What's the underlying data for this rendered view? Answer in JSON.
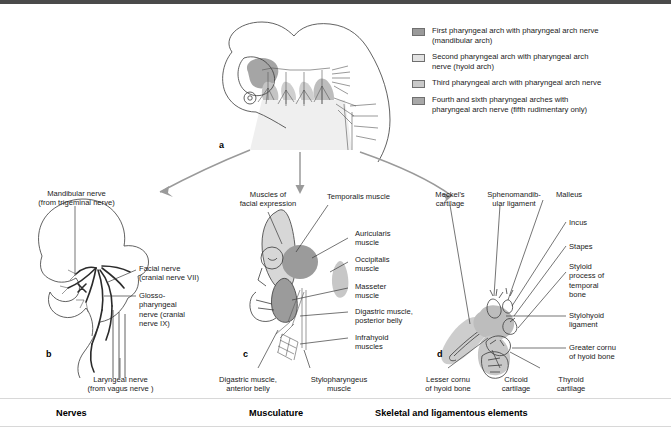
{
  "figure": {
    "title_hidden": "Derivatives of the pharyngeal arches",
    "panel_letters": {
      "a": "a",
      "b": "b",
      "c": "c",
      "d": "d"
    }
  },
  "legend": {
    "items": [
      {
        "swatch_name": "first-arch-swatch",
        "color": "#9a9a9a",
        "text": "First pharyngeal arch with pharyngeal arch nerve\n(mandibular arch)"
      },
      {
        "swatch_name": "second-arch-swatch",
        "color": "#e2e2e2",
        "text": "Second pharyngeal arch with pharyngeal arch\nnerve (hyoid arch)"
      },
      {
        "swatch_name": "third-arch-swatch",
        "color": "#c9c9c9",
        "text": "Third pharyngeal arch with pharyngeal arch nerve"
      },
      {
        "swatch_name": "fourth-sixth-arch-swatch",
        "color": "#a8a8a8",
        "text": "Fourth and sixth pharyngeal arches with\npharyngeal arch nerve (fifth rudimentary only)"
      }
    ]
  },
  "panel_a": {
    "letter": "a"
  },
  "panel_b": {
    "letter": "b",
    "category": "Nerves",
    "labels": [
      {
        "name": "mandibular-nerve-label",
        "text": "Mandibular nerve\n(from trigeminal nerve)"
      },
      {
        "name": "facial-nerve-label",
        "text": "Facial nerve\n(cranial nerve VII)"
      },
      {
        "name": "glossopharyngeal-nerve-label",
        "text": "Glosso-\npharyngeal\nnerve (cranial\nnerve IX)"
      },
      {
        "name": "laryngeal-nerve-label",
        "text": "Laryngeal nerve\n(from vagus nerve  )"
      }
    ]
  },
  "panel_c": {
    "letter": "c",
    "category": "Musculature",
    "labels": [
      {
        "name": "muscles-facial-expression-label",
        "text": "Muscles of\nfacial expression"
      },
      {
        "name": "temporalis-muscle-label",
        "text": "Temporalis muscle"
      },
      {
        "name": "auricularis-muscle-label",
        "text": "Auricularis\nmuscle"
      },
      {
        "name": "occipitalis-muscle-label",
        "text": "Occipitalis\nmuscle"
      },
      {
        "name": "masseter-muscle-label",
        "text": "Masseter\nmuscle"
      },
      {
        "name": "digastric-posterior-belly-label",
        "text": "Digastric muscle,\nposterior belly"
      },
      {
        "name": "infrahyoid-muscles-label",
        "text": "Infrahyoid\nmuscles"
      },
      {
        "name": "digastric-anterior-belly-label",
        "text": "Digastric muscle,\nanterior belly"
      },
      {
        "name": "stylopharyngeus-muscle-label",
        "text": "Stylopharyngeus\nmuscle"
      }
    ]
  },
  "panel_d": {
    "letter": "d",
    "category": "Skeletal and ligamentous elements",
    "labels": [
      {
        "name": "meckels-cartilage-label",
        "text": "Meckel's\ncartilage"
      },
      {
        "name": "sphenomandibular-ligament-label",
        "text": "Sphenomandib-\nular ligament"
      },
      {
        "name": "malleus-label",
        "text": "Malleus"
      },
      {
        "name": "incus-label",
        "text": "Incus"
      },
      {
        "name": "stapes-label",
        "text": "Stapes"
      },
      {
        "name": "styloid-process-label",
        "text": "Styloid\nprocess of\ntemporal\nbone"
      },
      {
        "name": "stylohyoid-ligament-label",
        "text": "Stylohyoid\nligament"
      },
      {
        "name": "greater-cornu-hyoid-label",
        "text": "Greater cornu\nof hyoid bone"
      },
      {
        "name": "lesser-cornu-hyoid-label",
        "text": "Lesser cornu\nof hyoid bone"
      },
      {
        "name": "cricoid-cartilage-label",
        "text": "Cricoid\ncartilage"
      },
      {
        "name": "thyroid-cartilage-label",
        "text": "Thyroid\ncartilage"
      }
    ]
  },
  "colors": {
    "arch1": "#9a9a9a",
    "arch2": "#e2e2e2",
    "arch3": "#c9c9c9",
    "arch4": "#a8a8a8",
    "ink": "#1a1a1a",
    "leader": "#3a3a3a",
    "arrow": "#9a9a9a"
  }
}
